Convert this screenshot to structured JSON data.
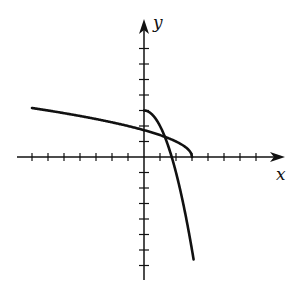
{
  "chart_data": {
    "type": "line",
    "title": "",
    "xlabel": "x",
    "ylabel": "y",
    "xlim": [
      -7,
      8
    ],
    "ylim": [
      -7,
      7
    ],
    "grid": false,
    "legend": null,
    "x_ticks": [
      -7,
      -6,
      -5,
      -4,
      -3,
      -2,
      -1,
      1,
      2,
      3,
      4,
      5,
      6,
      7
    ],
    "y_ticks": [
      -7,
      -6,
      -5,
      -4,
      -3,
      -2,
      -1,
      1,
      2,
      3,
      4,
      5,
      6,
      7
    ],
    "tick_labels_shown": false,
    "series": [
      {
        "name": "y = sqrt(3 - x)",
        "x": [
          -7,
          -6,
          -5,
          -4,
          -3,
          -2,
          -1,
          0,
          1,
          1.5,
          2,
          2.5,
          2.8,
          3
        ],
        "y": [
          3.16,
          3.0,
          2.83,
          2.65,
          2.45,
          2.24,
          2.0,
          1.73,
          1.41,
          1.22,
          1.0,
          0.71,
          0.45,
          0
        ]
      },
      {
        "name": "y = 3 - x^2",
        "x": [
          0,
          0.5,
          1,
          1.5,
          1.73,
          2,
          2.5,
          3,
          3.1
        ],
        "y": [
          3,
          2.75,
          2,
          0.75,
          0,
          -1,
          -3.25,
          -6,
          -6.61
        ]
      }
    ],
    "colors": {
      "axis": "#111111",
      "curve": "#111111",
      "background": "#ffffff"
    }
  },
  "labels": {
    "x_axis": "x",
    "y_axis": "y"
  }
}
